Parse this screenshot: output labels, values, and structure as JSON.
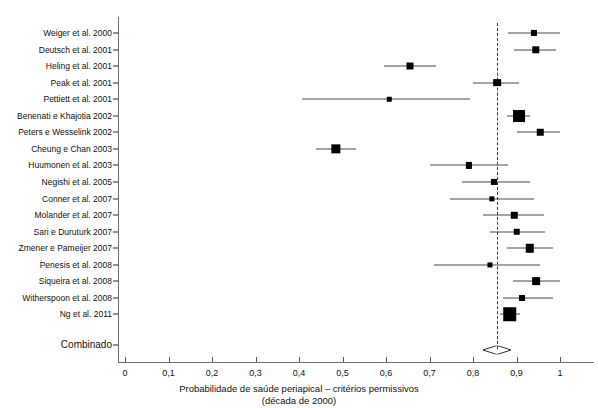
{
  "chart_data": {
    "type": "forest",
    "title": "",
    "xlabel": "Probabilidade de saúde periapical – critérios permissivos",
    "xlabel_line2": "(década de 2000)",
    "ylabel": "",
    "xlim": [
      0,
      1
    ],
    "xticks": [
      0,
      0.1,
      0.2,
      0.3,
      0.4,
      0.5,
      0.6,
      0.7,
      0.8,
      0.9,
      1
    ],
    "xticklabels": [
      "0",
      "0,1",
      "0,2",
      "0,3",
      "0,4",
      "0,5",
      "0,6",
      "0,7",
      "0,8",
      "0,9",
      "1"
    ],
    "grid": false,
    "legend": "none",
    "reference_line": 0.855,
    "summary_label": "Combinado",
    "summary": {
      "estimate": 0.855,
      "ci_low": 0.823,
      "ci_high": 0.888
    },
    "studies": [
      {
        "label": "Weiger et al. 2000",
        "estimate": 0.94,
        "ci_low": 0.88,
        "ci_high": 1.0,
        "weight": 0.3
      },
      {
        "label": "Deutsch et al. 2001",
        "estimate": 0.945,
        "ci_low": 0.895,
        "ci_high": 0.99,
        "weight": 0.42
      },
      {
        "label": "Heling et al. 2001",
        "estimate": 0.655,
        "ci_low": 0.595,
        "ci_high": 0.715,
        "weight": 0.38
      },
      {
        "label": "Peak et al. 2001",
        "estimate": 0.855,
        "ci_low": 0.8,
        "ci_high": 0.905,
        "weight": 0.45
      },
      {
        "label": "Pettiett et al. 2001",
        "estimate": 0.608,
        "ci_low": 0.408,
        "ci_high": 0.793,
        "weight": 0.14
      },
      {
        "label": "Benenati e Khajotia 2002",
        "estimate": 0.905,
        "ci_low": 0.878,
        "ci_high": 0.932,
        "weight": 0.85
      },
      {
        "label": "Peters e Wesselink 2002",
        "estimate": 0.955,
        "ci_low": 0.9,
        "ci_high": 1.0,
        "weight": 0.33
      },
      {
        "label": "Cheung e Chan 2003",
        "estimate": 0.485,
        "ci_low": 0.44,
        "ci_high": 0.53,
        "weight": 0.6
      },
      {
        "label": "Huumonen et al. 2003",
        "estimate": 0.79,
        "ci_low": 0.7,
        "ci_high": 0.88,
        "weight": 0.3
      },
      {
        "label": "Negishi et al. 2005",
        "estimate": 0.848,
        "ci_low": 0.775,
        "ci_high": 0.93,
        "weight": 0.3
      },
      {
        "label": "Conner et al. 2007",
        "estimate": 0.843,
        "ci_low": 0.748,
        "ci_high": 0.94,
        "weight": 0.22
      },
      {
        "label": "Molander et al. 2007",
        "estimate": 0.895,
        "ci_low": 0.823,
        "ci_high": 0.963,
        "weight": 0.33
      },
      {
        "label": "Sari e Duruturk 2007",
        "estimate": 0.9,
        "ci_low": 0.838,
        "ci_high": 0.965,
        "weight": 0.33
      },
      {
        "label": "Zmener e Pameijer 2007",
        "estimate": 0.93,
        "ci_low": 0.878,
        "ci_high": 0.985,
        "weight": 0.52
      },
      {
        "label": "Penesis et al. 2008",
        "estimate": 0.838,
        "ci_low": 0.71,
        "ci_high": 0.955,
        "weight": 0.2
      },
      {
        "label": "Siqueira et al. 2008",
        "estimate": 0.945,
        "ci_low": 0.893,
        "ci_high": 1.0,
        "weight": 0.45
      },
      {
        "label": "Witherspoon et al. 2008",
        "estimate": 0.913,
        "ci_low": 0.87,
        "ci_high": 0.985,
        "weight": 0.28
      },
      {
        "label": "Ng et al. 2011",
        "estimate": 0.885,
        "ci_low": 0.862,
        "ci_high": 0.908,
        "weight": 1.0
      }
    ]
  }
}
